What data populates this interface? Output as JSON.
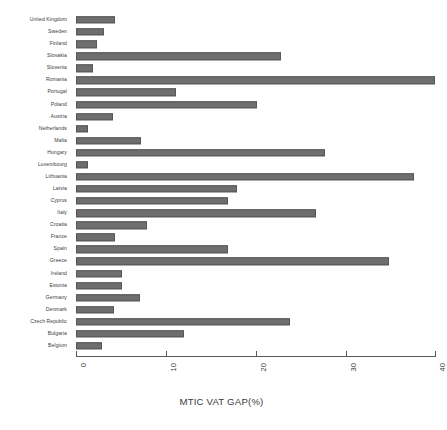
{
  "chart": {
    "axis_title": "MTIC VAT GAP(%)",
    "bar_color": "#6e6e6e",
    "bar_border_color": "#565656",
    "axis_color": "#5a5a5a"
  },
  "chart_data": {
    "type": "bar",
    "orientation": "horizontal",
    "title": "",
    "subtitle": "",
    "xlabel": "MTIC VAT GAP(%)",
    "ylabel": "",
    "xlim": [
      0,
      40
    ],
    "xticks": [
      0,
      10,
      20,
      30,
      40
    ],
    "xtick_labels": [
      "0",
      "10",
      "20",
      "30",
      "40"
    ],
    "grid": false,
    "legend": null,
    "categories": [
      "United Kingdom",
      "Sweden",
      "Finland",
      "Slovakia",
      "Slovenia",
      "Romania",
      "Portugal",
      "Poland",
      "Austria",
      "Netherlands",
      "Malta",
      "Hungary",
      "Luxembourg",
      "Lithuania",
      "Latvia",
      "Cyprus",
      "Italy",
      "Croatia",
      "France",
      "Spain",
      "Greece",
      "Ireland",
      "Estonia",
      "Germany",
      "Denmark",
      "Czech Republic",
      "Bulgaria",
      "Belgium"
    ],
    "values": [
      4.3,
      3.1,
      2.3,
      22.8,
      1.9,
      39.9,
      11.1,
      20.1,
      4.1,
      1.3,
      7.2,
      27.7,
      1.3,
      37.5,
      17.9,
      16.9,
      26.7,
      7.9,
      4.3,
      16.9,
      34.8,
      5.1,
      5.1,
      7.1,
      4.2,
      23.8,
      12.0,
      2.9
    ]
  }
}
